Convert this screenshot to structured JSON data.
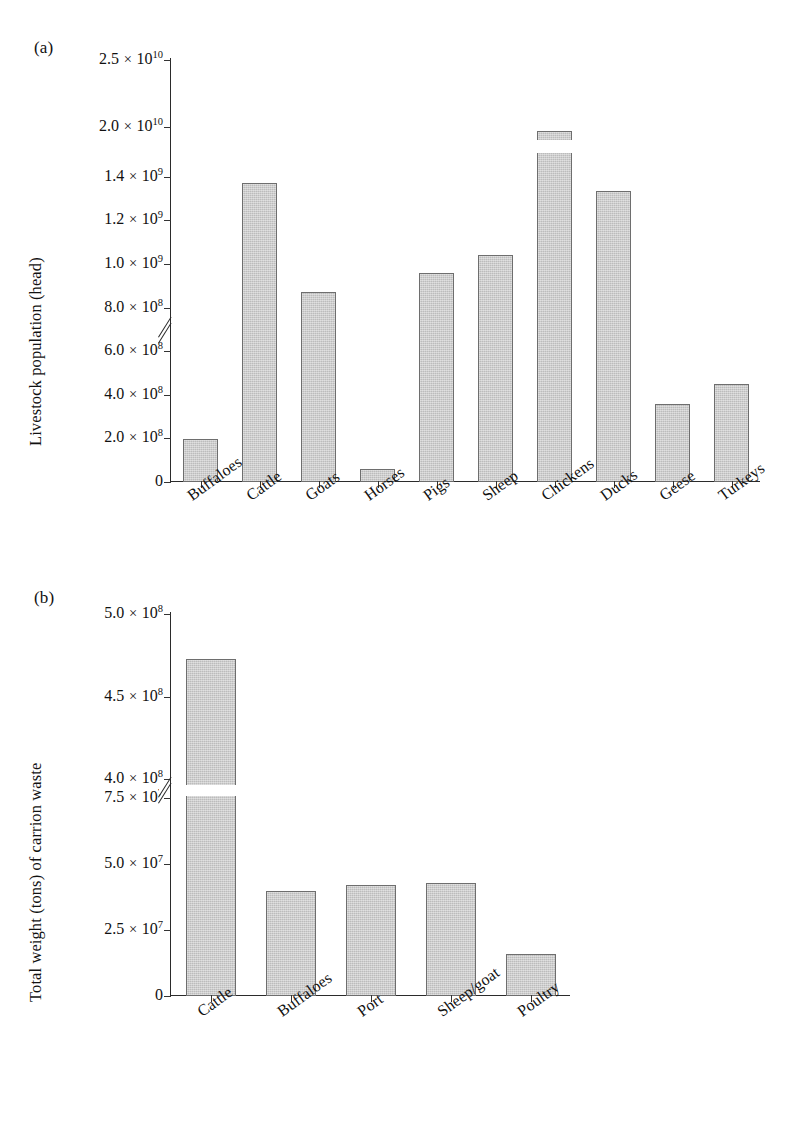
{
  "figure": {
    "background": "#ffffff",
    "bar_fill": "#c9c9c9",
    "bar_stroke": "#6e6e6e",
    "axis_color": "#2b2b2b"
  },
  "panel_a": {
    "tag": "(a)",
    "ylabel": "Livestock population (head)",
    "ticks": [
      {
        "label_mantissa": "2.5",
        "label_exp": "10",
        "sup": "10",
        "value": 25000000000.0
      },
      {
        "label_mantissa": "2.0",
        "label_exp": "10",
        "sup": "10",
        "value": 20000000000.0
      },
      {
        "label_mantissa": "1.4",
        "label_exp": "10",
        "sup": "9",
        "value": 1400000000.0
      },
      {
        "label_mantissa": "1.2",
        "label_exp": "10",
        "sup": "9",
        "value": 1200000000.0
      },
      {
        "label_mantissa": "1.0",
        "label_exp": "10",
        "sup": "9",
        "value": 1000000000.0
      },
      {
        "label_mantissa": "8.0",
        "label_exp": "10",
        "sup": "8",
        "value": 800000000.0
      },
      {
        "label_mantissa": "6.0",
        "label_exp": "10",
        "sup": "8",
        "value": 600000000.0
      },
      {
        "label_mantissa": "4.0",
        "label_exp": "10",
        "sup": "8",
        "value": 400000000.0
      },
      {
        "label_mantissa": "2.0",
        "label_exp": "10",
        "sup": "8",
        "value": 200000000.0
      },
      {
        "label_mantissa": "0",
        "label_exp": "",
        "sup": "",
        "value": 0
      }
    ],
    "categories": [
      "Buffaloes",
      "Cattle",
      "Goats",
      "Horses",
      "Pigs",
      "Sheep",
      "Chickens",
      "Ducks",
      "Geese",
      "Turkeys"
    ],
    "values": [
      195000000.0,
      1370000000.0,
      870000000.0,
      58000000.0,
      960000000.0,
      1040000000.0,
      19700000000.0,
      1335000000.0,
      360000000.0,
      450000000.0
    ],
    "has_axis_break": true,
    "break_between": [
      2000000000.0,
      1400000000.0
    ]
  },
  "panel_b": {
    "tag": "(b)",
    "ylabel": "Total weight (tons) of carrion waste",
    "ticks": [
      {
        "label_mantissa": "5.0",
        "label_exp": "10",
        "sup": "8",
        "value": 500000000.0
      },
      {
        "label_mantissa": "4.5",
        "label_exp": "10",
        "sup": "8",
        "value": 450000000.0
      },
      {
        "label_mantissa": "4.0",
        "label_exp": "10",
        "sup": "8",
        "value": 400000000.0
      },
      {
        "label_mantissa": "7.5",
        "label_exp": "10",
        "sup": "7",
        "value": 75000000.0
      },
      {
        "label_mantissa": "5.0",
        "label_exp": "10",
        "sup": "7",
        "value": 50000000.0
      },
      {
        "label_mantissa": "2.5",
        "label_exp": "10",
        "sup": "7",
        "value": 25000000.0
      },
      {
        "label_mantissa": "0",
        "label_exp": "",
        "sup": "",
        "value": 0
      }
    ],
    "categories": [
      "Cattle",
      "Buffaloes",
      "Port",
      "Sheep/goat",
      "Poultry"
    ],
    "values": [
      473000000.0,
      40000000.0,
      42000000.0,
      43000000.0,
      16000000.0
    ],
    "has_axis_break": true,
    "break_between": [
      400000000.0,
      75000000.0
    ]
  },
  "chart_data": [
    {
      "type": "bar",
      "panel": "(a)",
      "title": "",
      "xlabel": "",
      "ylabel": "Livestock population (head)",
      "categories": [
        "Buffaloes",
        "Cattle",
        "Goats",
        "Horses",
        "Pigs",
        "Sheep",
        "Chickens",
        "Ducks",
        "Geese",
        "Turkeys"
      ],
      "values": [
        195000000,
        1370000000,
        870000000,
        58000000,
        960000000,
        1040000000,
        19700000000,
        1335000000,
        360000000,
        450000000
      ],
      "ytick_labels": [
        "0",
        "2.0 × 10^8",
        "4.0 × 10^8",
        "6.0 × 10^8",
        "8.0 × 10^8",
        "1.0 × 10^9",
        "1.2 × 10^9",
        "1.4 × 10^9",
        "2.0 × 10^10",
        "2.5 × 10^10"
      ],
      "ytick_values": [
        0,
        200000000.0,
        400000000.0,
        600000000.0,
        800000000.0,
        1000000000.0,
        1200000000.0,
        1400000000.0,
        20000000000.0,
        25000000000.0
      ],
      "ylim": [
        0,
        25000000000
      ],
      "axis_break": {
        "lower": 1500000000,
        "upper": 19000000000
      },
      "grid": false,
      "legend": "none",
      "bar_color": "#c9c9c9"
    },
    {
      "type": "bar",
      "panel": "(b)",
      "title": "",
      "xlabel": "",
      "ylabel": "Total weight (tons) of carrion waste",
      "categories": [
        "Cattle",
        "Buffaloes",
        "Port",
        "Sheep/goat",
        "Poultry"
      ],
      "values": [
        473000000,
        40000000,
        42000000,
        43000000,
        16000000
      ],
      "ytick_labels": [
        "0",
        "2.5 × 10^7",
        "5.0 × 10^7",
        "7.5 × 10^7",
        "4.0 × 10^8",
        "4.5 × 10^8",
        "5.0 × 10^8"
      ],
      "ytick_values": [
        0,
        25000000.0,
        50000000.0,
        75000000.0,
        400000000.0,
        450000000.0,
        500000000.0
      ],
      "ylim": [
        0,
        500000000
      ],
      "axis_break": {
        "lower": 80000000,
        "upper": 390000000
      },
      "grid": false,
      "legend": "none",
      "bar_color": "#c9c9c9"
    }
  ]
}
